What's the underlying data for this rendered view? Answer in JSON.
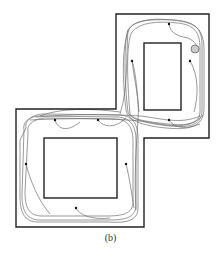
{
  "caption": "(b)",
  "colors": {
    "wall": "#222222",
    "trajectory": "#555555",
    "dot": "#111111",
    "goal_fill": "#cccccc",
    "goal_stroke": "#666666"
  },
  "environment": {
    "outline_points": [
      [
        116,
        14
      ],
      [
        209,
        14
      ],
      [
        209,
        138
      ],
      [
        144,
        138
      ],
      [
        144,
        227
      ],
      [
        16,
        227
      ],
      [
        16,
        109
      ],
      [
        116,
        109
      ]
    ],
    "obstacles": [
      {
        "name": "upper-obstacle",
        "x": 144,
        "y": 43,
        "w": 37,
        "h": 67
      },
      {
        "name": "lower-obstacle",
        "x": 44,
        "y": 138,
        "w": 73,
        "h": 60
      }
    ]
  },
  "start_points": [
    [
      169,
      24
    ],
    [
      132,
      61
    ],
    [
      190,
      61
    ],
    [
      169,
      120
    ],
    [
      55,
      120
    ],
    [
      98,
      120
    ],
    [
      26,
      164
    ],
    [
      126,
      164
    ],
    [
      76,
      208
    ]
  ],
  "goal": {
    "cx": 195,
    "cy": 49,
    "r": 4
  }
}
